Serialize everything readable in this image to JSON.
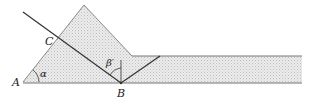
{
  "diagram": {
    "type": "optics-prism-coupler",
    "labels": {
      "A": "A",
      "B": "B",
      "C": "C",
      "alpha": "α",
      "beta_prime": "β′"
    },
    "colors": {
      "fill": "#e4e4e4",
      "stroke": "#555555",
      "ray": "#333333",
      "edge": "#777777"
    }
  }
}
